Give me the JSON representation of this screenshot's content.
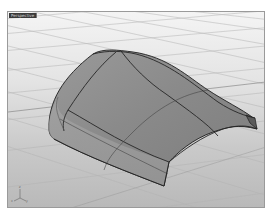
{
  "viewport": {
    "tab_label": "Perspective",
    "display_mode": "shaded",
    "colors": {
      "background_top": "#f4f4f4",
      "background_bottom": "#b9b9b9",
      "grid_line": "#b0b0b0",
      "surface_fill": "#8c8c8c",
      "surface_highlight": "#a8a8a8",
      "isocurve": "#2a2a2a",
      "border": "#9a9a9a"
    },
    "axes": {
      "x_label": "x",
      "y_label": "y",
      "z_label": "z"
    }
  },
  "model": {
    "object_type": "surface",
    "description": "Curved hood-like NURBS surface with isocurves"
  }
}
